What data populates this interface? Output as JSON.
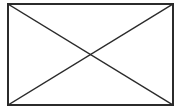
{
  "canvas": {
    "width": 182,
    "height": 111,
    "background_color": "#ffffff"
  },
  "placeholder": {
    "kind": "broken-image-placeholder",
    "alt_text": "",
    "stroke_color": "#2b2b2b",
    "fill_color": "#ffffff",
    "border_width": 1.4,
    "diagonal_width": 1.4,
    "frame": {
      "x": 8,
      "y": 4,
      "width": 165,
      "height": 101
    },
    "diagonals": [
      {
        "name": "diagonal-top-left-to-bottom-right",
        "x1": 8,
        "y1": 4,
        "x2": 173,
        "y2": 105
      },
      {
        "name": "diagonal-bottom-left-to-top-right",
        "x1": 8,
        "y1": 105,
        "x2": 173,
        "y2": 4
      }
    ],
    "crossing_point": {
      "x": 90.5,
      "y": 54.5
    }
  }
}
